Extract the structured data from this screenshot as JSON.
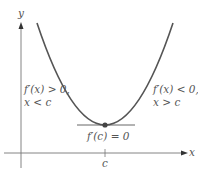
{
  "figure": {
    "axes": {
      "x_label": "x",
      "y_label": "y",
      "tick_label": "c"
    },
    "curve": {
      "type": "parabola",
      "description": "concave-up curve with minimum at x = c",
      "color": "#555555"
    },
    "critical_point": {
      "label": "f′(c) = 0",
      "color": "#444444"
    },
    "tangent_line": {
      "description": "horizontal tangent at critical point"
    },
    "left_annotation": {
      "line1": "f′(x) > 0,",
      "line2": "x < c"
    },
    "right_annotation": {
      "line1": "f′(x) < 0,",
      "line2": "x > c"
    }
  }
}
